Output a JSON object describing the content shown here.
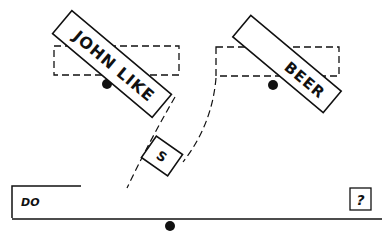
{
  "diagram": {
    "colors": {
      "ink": "#111111",
      "background": "#ffffff"
    },
    "tiles": {
      "left_tile": {
        "label": "JOHN LIKE",
        "rotation_deg": 40
      },
      "right_tile": {
        "label": "BEER",
        "rotation_deg": 40
      },
      "middle_tile": {
        "label": "S",
        "rotation_deg": 35
      }
    },
    "slots": {
      "left_slot": "dashed-rectangle",
      "right_slot": "dashed-rectangle"
    },
    "pivots": [
      "left-pivot-dot",
      "right-pivot-dot",
      "bottom-pivot-dot"
    ],
    "base": {
      "left_label": "DO",
      "right_label": "?"
    }
  }
}
